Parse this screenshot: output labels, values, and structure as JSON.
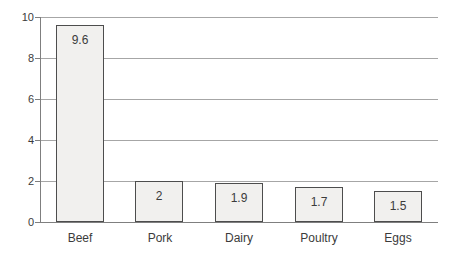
{
  "chart_data": {
    "type": "bar",
    "title": "",
    "xlabel": "",
    "ylabel": "",
    "categories": [
      "Beef",
      "Pork",
      "Dairy",
      "Poultry",
      "Eggs"
    ],
    "values": [
      9.6,
      2,
      1.9,
      1.7,
      1.5
    ],
    "value_labels": [
      "9.6",
      "2",
      "1.9",
      "1.7",
      "1.5"
    ],
    "ylim": [
      0,
      10
    ],
    "yticks": [
      0,
      2,
      4,
      6,
      8,
      10
    ],
    "ytick_labels": [
      "0",
      "2",
      "4",
      "6",
      "8",
      "10"
    ],
    "grid": "horizontal",
    "legend": "none",
    "colors": {
      "background": "#ffffff",
      "bar_fill": "#f1f0ee",
      "bar_border": "#4d4d4d",
      "gridline": "#a6a6a6",
      "axis_line": "#7f7f7f",
      "text": "#3b3b3b"
    }
  }
}
